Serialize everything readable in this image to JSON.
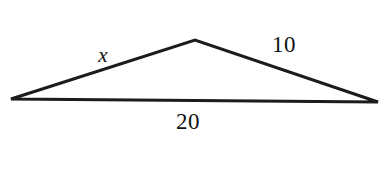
{
  "figure": {
    "type": "geometry-diagram",
    "shape": "triangle",
    "background_color": "#ffffff",
    "stroke_color": "#1a1a1a",
    "stroke_width": 3,
    "canvas": {
      "width": 387,
      "height": 180
    }
  },
  "triangle": {
    "vertices": {
      "left": {
        "x": 11,
        "y": 99
      },
      "apex": {
        "x": 195,
        "y": 40
      },
      "right": {
        "x": 378,
        "y": 102
      }
    },
    "path": "M 11 99 L 195 40 L 378 102 Z"
  },
  "labels": {
    "left_side": {
      "text": "x",
      "style": "italic",
      "x": 103,
      "y": 55,
      "describes": "left-slanted-side"
    },
    "right_side": {
      "text": "10",
      "style": "normal",
      "x": 284,
      "y": 44,
      "describes": "right-slanted-side"
    },
    "base": {
      "text": "20",
      "style": "normal",
      "x": 188,
      "y": 121,
      "describes": "bottom-base-side"
    }
  }
}
